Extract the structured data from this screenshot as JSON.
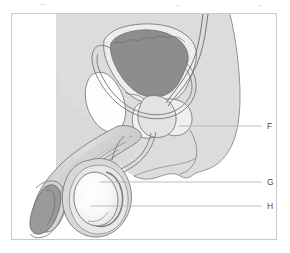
{
  "figure": {
    "title": "",
    "type": "anatomical-diagram",
    "frame": {
      "border_color": "#c9c9c9",
      "background_color": "#ffffff"
    },
    "palette": {
      "body_fill": "#dcdcdc",
      "body_stroke": "#7a7a7a",
      "organ_light": "#f0f0f0",
      "organ_mid": "#c4c4c4",
      "organ_dark": "#8d8d8d",
      "organ_white": "#fbfbfb",
      "leader_line": "#b5b5b5",
      "label_text": "#4a4a4a"
    },
    "labels": [
      {
        "id": "F",
        "text": "F",
        "callout_y": 126,
        "callout_x_start": 178,
        "callout_x_end": 262
      },
      {
        "id": "G",
        "text": "G",
        "callout_y": 182,
        "callout_x_start": 100,
        "callout_x_end": 262
      },
      {
        "id": "H",
        "text": "H",
        "callout_y": 206,
        "callout_x_start": 90,
        "callout_x_end": 262
      }
    ],
    "structures": [
      {
        "name": "body-silhouette",
        "fill": "#dcdcdc"
      },
      {
        "name": "bladder",
        "fill": "#8d8d8d"
      },
      {
        "name": "bladder-wall",
        "fill": "#e8e8e8"
      },
      {
        "name": "pubic-bone",
        "fill": "#fdfdfd"
      },
      {
        "name": "prostate",
        "fill": "#e0e0e0"
      },
      {
        "name": "seminal-vesicle",
        "fill": "#efefef"
      },
      {
        "name": "vas-deferens",
        "fill": "none"
      },
      {
        "name": "urethra",
        "fill": "none"
      },
      {
        "name": "penis-shaft",
        "fill": "#d2d2d2"
      },
      {
        "name": "glans-penis",
        "fill": "#9a9a9a"
      },
      {
        "name": "scrotum",
        "fill": "#d8d8d8"
      },
      {
        "name": "testis",
        "fill": "#fcfcfc"
      },
      {
        "name": "epididymis",
        "fill": "#e6e6e6"
      }
    ]
  }
}
